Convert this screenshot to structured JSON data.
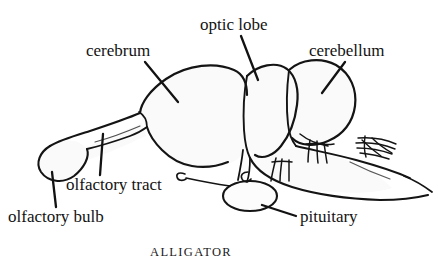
{
  "figure": {
    "caption": "ALLIGATOR",
    "background_color": "#ffffff",
    "ink_color": "#141414",
    "fill_color": "#fbfbfb",
    "labels": [
      {
        "id": "cerebrum",
        "text": "cerebrum",
        "leader": "diagonal down-right"
      },
      {
        "id": "optic-lobe",
        "text": "optic lobe",
        "leader": "diagonal down-right"
      },
      {
        "id": "cerebellum",
        "text": "cerebellum",
        "leader": "diagonal down-left"
      },
      {
        "id": "olfactory-tract",
        "text": "olfactory tract",
        "leader": "vertical up"
      },
      {
        "id": "olfactory-bulb",
        "text": "olfactory bulb",
        "leader": "vertical up"
      },
      {
        "id": "pituitary",
        "text": "pituitary",
        "leader": "diagonal up-left"
      }
    ],
    "structures": [
      "olfactory bulb",
      "olfactory tract",
      "cerebrum",
      "optic lobe",
      "cerebellum",
      "medulla",
      "pituitary",
      "cranial nerve roots",
      "spinal cord"
    ]
  }
}
